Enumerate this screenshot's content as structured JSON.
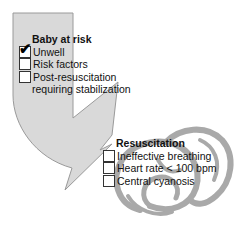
{
  "colors": {
    "arrow_fill": "#d9d9d9",
    "arrow_stroke": "#9a9a9a",
    "baby_stroke": "#a8a8a8",
    "text": "#111111"
  },
  "baby_at_risk": {
    "title": "Baby at risk",
    "items": [
      {
        "label": "Unwell",
        "checked": true
      },
      {
        "label": "Risk factors",
        "checked": false
      },
      {
        "label": "Post-resuscitation",
        "checked": false
      }
    ],
    "continuation": "requiring stabilization"
  },
  "resuscitation": {
    "title": "Resuscitation",
    "items": [
      {
        "label": "Ineffective breathing",
        "checked": false
      },
      {
        "label": "Heart rate < 100 bpm",
        "checked": false
      },
      {
        "label": "Central cyanosis",
        "checked": false
      }
    ]
  },
  "icons": {
    "arrow": "curved-arrow-shape",
    "baby": "curled-baby-figure",
    "check": "checkmark-glyph"
  }
}
